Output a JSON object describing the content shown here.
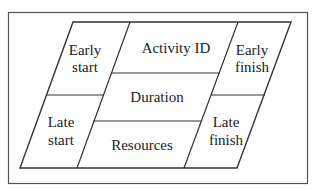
{
  "diagram": {
    "type": "activity-on-node box",
    "cells": {
      "early_start": [
        "Early",
        "start"
      ],
      "activity_id": "Activity ID",
      "early_finish": [
        "Early",
        "finish"
      ],
      "duration": "Duration",
      "late_start": [
        "Late",
        "start"
      ],
      "resources": "Resources",
      "late_finish": [
        "Late",
        "finish"
      ]
    },
    "colors": {
      "line": "#333333",
      "text": "#222222",
      "frame": "#555555"
    }
  }
}
